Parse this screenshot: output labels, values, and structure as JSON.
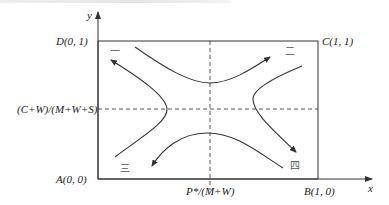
{
  "diagram": {
    "axes": {
      "x_label": "x",
      "y_label": "y"
    },
    "corners": {
      "A": "A(0, 0)",
      "B": "B(1, 0)",
      "C": "C(1, 1)",
      "D": "D(0, 1)"
    },
    "thresholds": {
      "y_threshold_label": "(C+W)/(M+W+S)",
      "x_threshold_label": "P*/(M+W)"
    },
    "regions": [
      {
        "id": "one",
        "label": "一",
        "position": "top-left"
      },
      {
        "id": "two",
        "label": "二",
        "position": "top-right"
      },
      {
        "id": "three",
        "label": "三",
        "position": "bottom-left"
      },
      {
        "id": "four",
        "label": "四",
        "position": "bottom-right"
      }
    ],
    "trajectories": [
      {
        "name": "top-curve",
        "direction": "toward C (upper right)"
      },
      {
        "name": "left-curve",
        "direction": "toward D (upper left)"
      },
      {
        "name": "bottom-curve",
        "direction": "toward A (lower left)"
      },
      {
        "name": "right-curve",
        "direction": "toward B (lower right)"
      }
    ]
  }
}
